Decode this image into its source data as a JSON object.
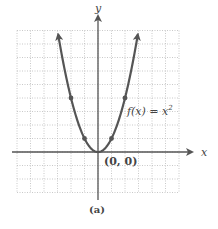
{
  "chart_data": {
    "type": "line",
    "title": "",
    "caption": "(a)",
    "function_label": "f(x) = x²",
    "function_label_parts": {
      "fx": "f(x) = x",
      "exp": "2"
    },
    "xlabel": "x",
    "ylabel": "y",
    "xlim": [
      -6,
      6
    ],
    "ylim": [
      -3,
      9
    ],
    "grid": true,
    "grid_style": "dotted",
    "series": [
      {
        "name": "f(x) = x^2",
        "x": [
          -3,
          -2,
          -1,
          0,
          1,
          2,
          3
        ],
        "y": [
          9,
          4,
          1,
          0,
          1,
          4,
          9
        ],
        "marked_points": [
          [
            -2,
            4
          ],
          [
            -1,
            1
          ],
          [
            0,
            0
          ],
          [
            1,
            1
          ],
          [
            2,
            4
          ]
        ],
        "arrows_at_ends": true
      }
    ],
    "annotations": [
      {
        "text": "(0, 0)",
        "x": 0,
        "y": 0
      }
    ],
    "colors": {
      "curve": "#555555",
      "axis": "#555555",
      "grid": "#bbbbbb"
    }
  }
}
